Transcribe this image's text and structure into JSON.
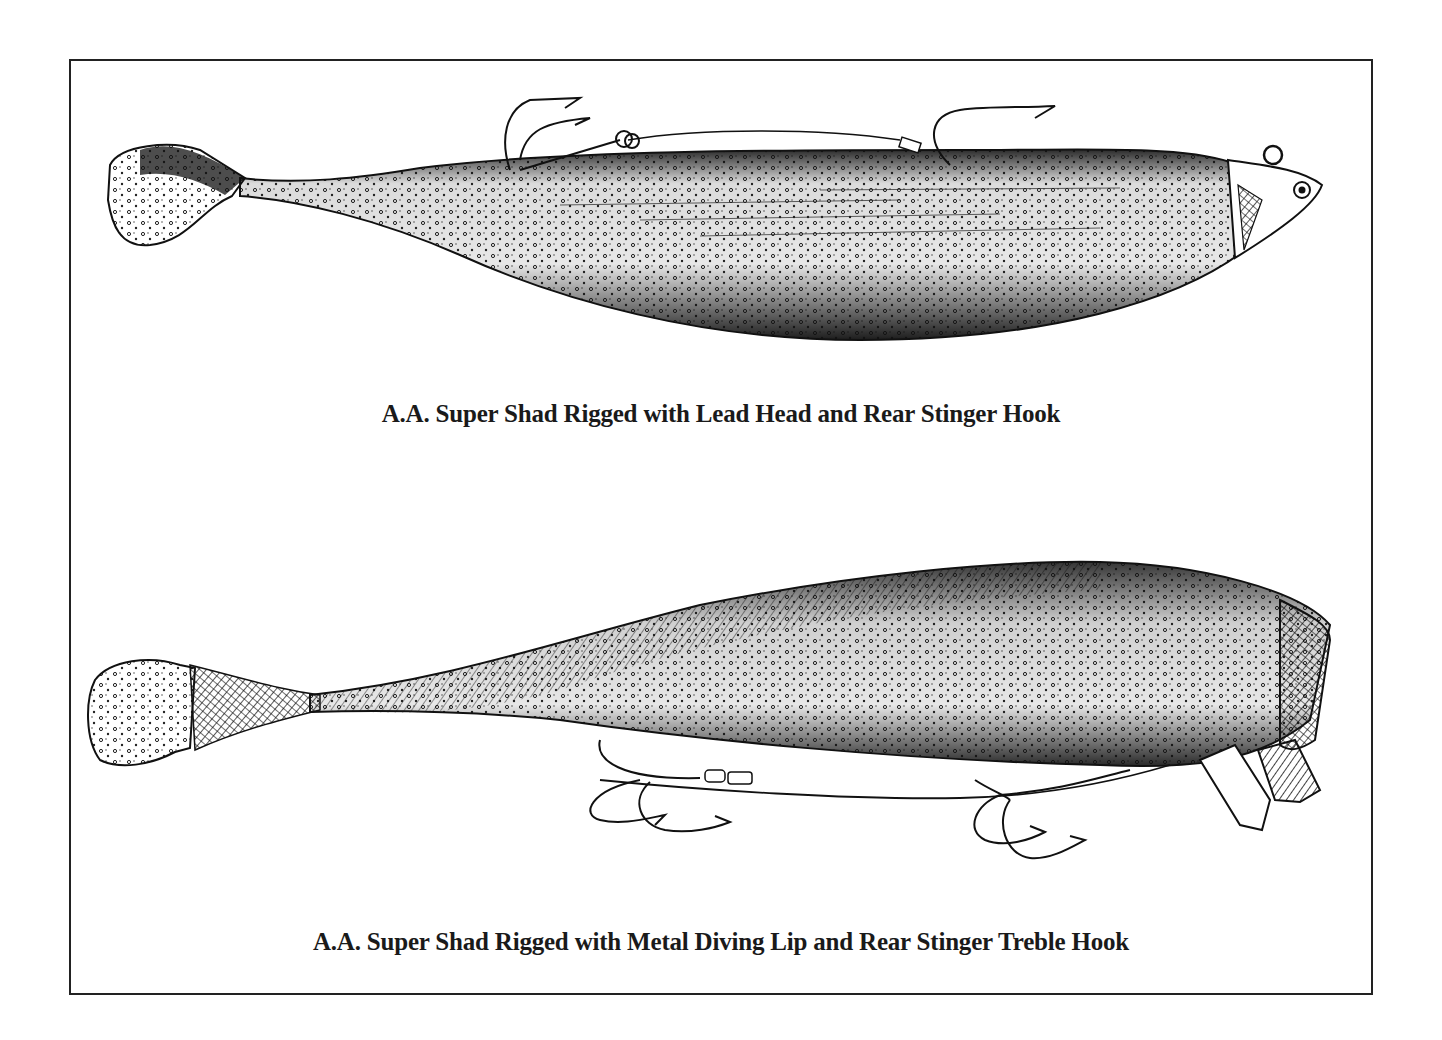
{
  "figure": {
    "frame": {
      "border_color": "#222222"
    },
    "panels": [
      {
        "id": "top",
        "subject": "soft plastic swimbait with lead jig head, trailing treble stinger hook and single hook",
        "caption": "A.A. Super Shad Rigged with Lead Head and Rear Stinger Hook"
      },
      {
        "id": "bottom",
        "subject": "soft plastic swimbait with metal diving lip and two treble hooks on wire stinger",
        "caption": "A.A. Super Shad Rigged with Metal Diving Lip and Rear Stinger Treble Hook"
      }
    ],
    "colors": {
      "ink": "#111111",
      "paper": "#ffffff"
    }
  }
}
